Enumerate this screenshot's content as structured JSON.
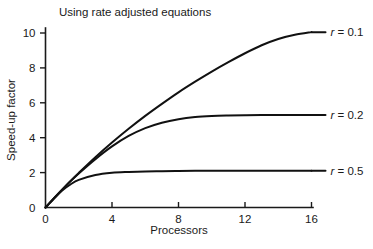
{
  "chart_data": {
    "type": "line",
    "title": "Using rate adjusted equations",
    "xlabel": "Processors",
    "ylabel": "Speed-up factor",
    "xlim": [
      0,
      16
    ],
    "ylim": [
      0,
      11
    ],
    "xticks": [
      "0",
      "4",
      "8",
      "12",
      "16"
    ],
    "xtick_values": [
      0,
      4,
      8,
      12,
      16
    ],
    "yticks": [
      "0",
      "2",
      "4",
      "6",
      "8",
      "10"
    ],
    "ytick_values": [
      0,
      2,
      4,
      6,
      8,
      10
    ],
    "grid": false,
    "legend_position": "right-inline-labels",
    "series": [
      {
        "name": "r = 0.1",
        "symbol": "r",
        "equals": " = ",
        "value": "0.1",
        "r": 0.1,
        "asymptote": 10.1,
        "x": [
          0,
          0.5,
          1,
          1.5,
          2,
          3,
          4,
          5,
          6,
          7,
          8,
          9,
          10,
          11,
          12,
          13,
          14,
          15,
          16
        ],
        "values": [
          0,
          0.52,
          1.02,
          1.51,
          1.98,
          2.88,
          3.72,
          4.51,
          5.25,
          5.94,
          6.6,
          7.21,
          7.79,
          8.33,
          8.84,
          9.3,
          9.66,
          9.9,
          10.05
        ]
      },
      {
        "name": "r = 0.2",
        "symbol": "r",
        "equals": " = ",
        "value": "0.2",
        "r": 0.2,
        "asymptote": 5.3,
        "x": [
          0,
          0.5,
          1,
          1.5,
          2,
          3,
          4,
          5,
          6,
          7,
          8,
          9,
          10,
          11,
          12,
          13,
          14,
          15,
          16
        ],
        "values": [
          0,
          0.52,
          1.02,
          1.5,
          1.95,
          2.77,
          3.5,
          4.1,
          4.55,
          4.86,
          5.06,
          5.18,
          5.24,
          5.27,
          5.29,
          5.3,
          5.3,
          5.3,
          5.3
        ]
      },
      {
        "name": "r = 0.5",
        "symbol": "r",
        "equals": " = ",
        "value": "0.5",
        "r": 0.5,
        "asymptote": 2.1,
        "x": [
          0,
          0.5,
          1,
          1.5,
          2,
          3,
          4,
          5,
          6,
          7,
          8,
          9,
          10,
          11,
          12,
          13,
          14,
          15,
          16
        ],
        "values": [
          0,
          0.5,
          0.97,
          1.32,
          1.58,
          1.86,
          1.99,
          2.04,
          2.07,
          2.08,
          2.09,
          2.1,
          2.1,
          2.1,
          2.1,
          2.1,
          2.1,
          2.1,
          2.1
        ]
      }
    ]
  }
}
